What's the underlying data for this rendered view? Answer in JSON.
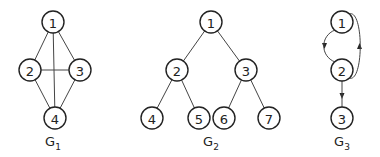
{
  "graphs": [
    {
      "id": "G1",
      "label": "G",
      "subscript": "1",
      "label_pos": [
        53,
        146
      ],
      "directed": false,
      "nodes": [
        {
          "id": "1",
          "x": 53,
          "y": 22
        },
        {
          "id": "2",
          "x": 30,
          "y": 70
        },
        {
          "id": "3",
          "x": 80,
          "y": 70
        },
        {
          "id": "4",
          "x": 55,
          "y": 118
        }
      ],
      "edges": [
        [
          "1",
          "2"
        ],
        [
          "1",
          "3"
        ],
        [
          "1",
          "4"
        ],
        [
          "2",
          "3"
        ],
        [
          "2",
          "4"
        ],
        [
          "3",
          "4"
        ]
      ]
    },
    {
      "id": "G2",
      "label": "G",
      "subscript": "2",
      "label_pos": [
        211,
        146
      ],
      "directed": false,
      "nodes": [
        {
          "id": "1",
          "x": 211,
          "y": 22
        },
        {
          "id": "2",
          "x": 177,
          "y": 70
        },
        {
          "id": "3",
          "x": 246,
          "y": 70
        },
        {
          "id": "4",
          "x": 152,
          "y": 118
        },
        {
          "id": "5",
          "x": 199,
          "y": 118
        },
        {
          "id": "6",
          "x": 224,
          "y": 118
        },
        {
          "id": "7",
          "x": 269,
          "y": 118
        }
      ],
      "edges": [
        [
          "1",
          "2"
        ],
        [
          "1",
          "3"
        ],
        [
          "2",
          "4"
        ],
        [
          "2",
          "5"
        ],
        [
          "3",
          "6"
        ],
        [
          "3",
          "7"
        ]
      ]
    },
    {
      "id": "G3",
      "label": "G",
      "subscript": "3",
      "label_pos": [
        342,
        146
      ],
      "directed": true,
      "nodes": [
        {
          "id": "1",
          "x": 342,
          "y": 22
        },
        {
          "id": "2",
          "x": 342,
          "y": 70
        },
        {
          "id": "3",
          "x": 342,
          "y": 118
        }
      ],
      "edges": [
        [
          "1",
          "2",
          "left-arc"
        ],
        [
          "2",
          "1",
          "right-arc"
        ],
        [
          "2",
          "3",
          "straight"
        ]
      ]
    }
  ],
  "style": {
    "stroke": "#222222",
    "background": "#ffffff",
    "node_radius": 11
  }
}
